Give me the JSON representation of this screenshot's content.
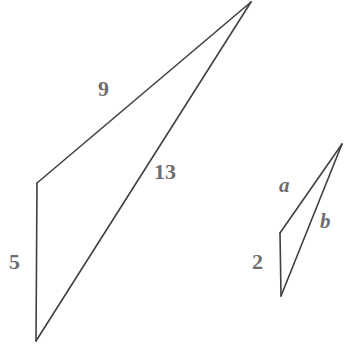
{
  "diagram": {
    "background_color": "#ffffff",
    "line_color": "#3f4043",
    "label_color": "#6e6e70",
    "large_figure": {
      "name": "large-triangle",
      "vertices": {
        "apex": [
          251,
          2
        ],
        "left_corner": [
          37,
          183
        ],
        "bottom": [
          36,
          341
        ]
      },
      "edges": [
        {
          "name": "left-vertical-edge",
          "label": "5",
          "from": "left_corner",
          "to": "bottom"
        },
        {
          "name": "upper-slant-edge",
          "label": "9",
          "from": "left_corner",
          "to": "apex"
        },
        {
          "name": "long-diagonal-edge",
          "label": "13",
          "from": "bottom",
          "to": "apex"
        }
      ]
    },
    "small_figure": {
      "name": "small-triangle",
      "vertices": {
        "apex": [
          342,
          144
        ],
        "left_corner": [
          280,
          233
        ],
        "bottom": [
          281,
          296
        ]
      },
      "edges": [
        {
          "name": "left-vertical-edge",
          "label": "2",
          "from": "left_corner",
          "to": "bottom"
        },
        {
          "name": "upper-slant-edge",
          "label": "a",
          "from": "left_corner",
          "to": "apex"
        },
        {
          "name": "long-diagonal-edge",
          "label": "b",
          "from": "bottom",
          "to": "apex"
        }
      ]
    },
    "labels": {
      "nine": "9",
      "thirteen": "13",
      "five": "5",
      "a": "a",
      "b": "b",
      "two": "2"
    }
  }
}
